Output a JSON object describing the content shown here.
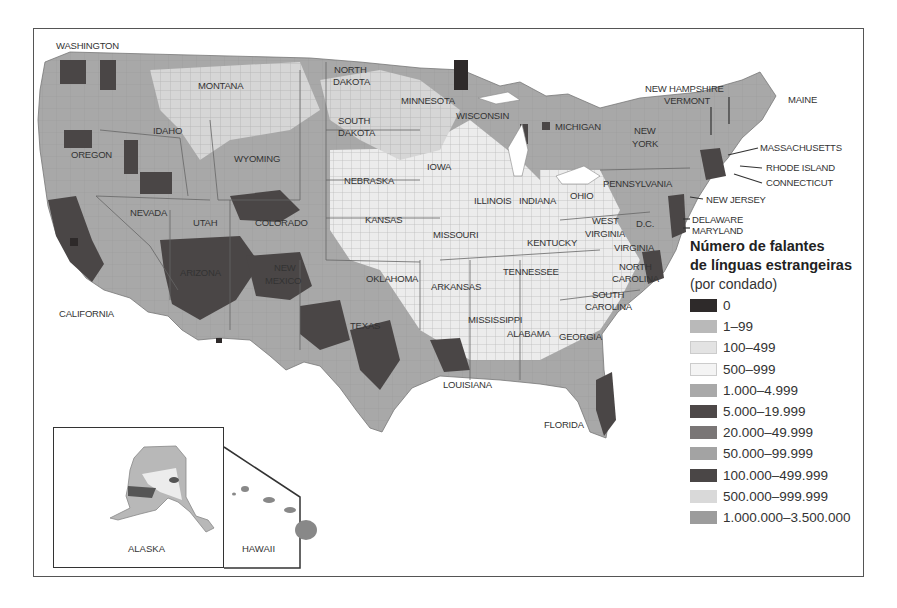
{
  "map": {
    "title_lines": [
      "Número de falantes",
      "de línguas estrangeiras"
    ],
    "subtitle": "(por condado)",
    "legend": [
      {
        "label": "0",
        "color": "#2e2a2a"
      },
      {
        "label": "1–99",
        "color": "#b9b9b9"
      },
      {
        "label": "100–499",
        "color": "#e3e3e3"
      },
      {
        "label": "500–999",
        "color": "#f4f4f4"
      },
      {
        "label": "1.000–4.999",
        "color": "#a9a9a9"
      },
      {
        "label": "5.000–19.999",
        "color": "#4d4848"
      },
      {
        "label": "20.000–49.999",
        "color": "#7a7676"
      },
      {
        "label": "50.000–99.999",
        "color": "#a3a3a3"
      },
      {
        "label": "100.000–499.999",
        "color": "#4a4646"
      },
      {
        "label": "500.000–999.999",
        "color": "#d9d9d9"
      },
      {
        "label": "1.000.000–3.500.000",
        "color": "#9c9c9c"
      }
    ],
    "state_labels": {
      "washington": "WASHINGTON",
      "montana": "MONTANA",
      "north_dakota_1": "NORTH",
      "north_dakota_2": "DAKOTA",
      "minnesota": "MINNESOTA",
      "south_dakota_1": "SOUTH",
      "south_dakota_2": "DAKOTA",
      "wisconsin": "WISCONSIN",
      "michigan": "MICHIGAN",
      "idaho": "IDAHO",
      "oregon": "OREGON",
      "wyoming": "WYOMING",
      "iowa": "IOWA",
      "nebraska": "NEBRASKA",
      "illinois": "ILLINOIS",
      "indiana": "INDIANA",
      "ohio": "OHIO",
      "nevada": "NEVADA",
      "utah": "UTAH",
      "colorado": "COLORADO",
      "kansas": "KANSAS",
      "missouri": "MISSOURI",
      "kentucky": "KENTUCKY",
      "west_virginia_1": "WEST",
      "west_virginia_2": "VIRGINIA",
      "dc": "D.C.",
      "virginia": "VIRGINIA",
      "arizona": "ARIZONA",
      "new_mexico_1": "NEW",
      "new_mexico_2": "MEXICO",
      "oklahoma": "OKLAHOMA",
      "arkansas": "ARKANSAS",
      "tennessee": "TENNESSEE",
      "north_carolina_1": "NORTH",
      "north_carolina_2": "CAROLINA",
      "south_carolina_1": "SOUTH",
      "south_carolina_2": "CAROLINA",
      "california": "CALIFORNIA",
      "texas": "TEXAS",
      "mississippi": "MISSISSIPPI",
      "alabama": "ALABAMA",
      "georgia": "GEORGIA",
      "louisiana": "LOUISIANA",
      "florida": "FLORIDA",
      "new_hampshire": "NEW HAMPSHIRE",
      "vermont": "VERMONT",
      "maine": "MAINE",
      "new_york_1": "NEW",
      "new_york_2": "YORK",
      "massachusetts": "MASSACHUSETTS",
      "rhode_island": "RHODE ISLAND",
      "connecticut": "CONNECTICUT",
      "pennsylvania": "PENNSYLVANIA",
      "new_jersey": "NEW JERSEY",
      "delaware": "DELAWARE",
      "maryland": "MARYLAND",
      "alaska": "ALASKA",
      "hawaii": "HAWAII"
    }
  }
}
